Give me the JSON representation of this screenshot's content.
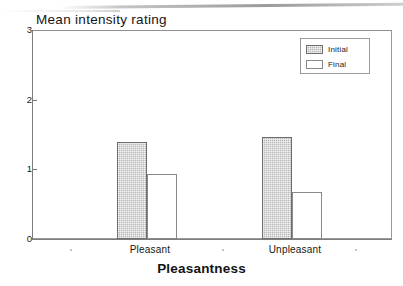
{
  "chart_data": {
    "type": "bar",
    "title": "Mean intensity rating",
    "xlabel": "Pleasantness",
    "ylabel": "",
    "categories": [
      "Pleasant",
      "Unpleasant"
    ],
    "series": [
      {
        "name": "Initial",
        "values": [
          1.39,
          1.47
        ],
        "color": "#b9b9b9"
      },
      {
        "name": "Final",
        "values": [
          0.93,
          0.68
        ],
        "color": "#ffffff"
      }
    ],
    "ylim": [
      0,
      3
    ],
    "yticks": [
      0,
      1,
      2,
      3
    ],
    "ytick_labels": [
      "0",
      "1",
      "2",
      "3"
    ],
    "grid": false,
    "legend_position": "top-right"
  },
  "legend": {
    "items": [
      {
        "label": "Initial",
        "swatch": "gray-hatched-swatch"
      },
      {
        "label": "Final",
        "swatch": "white-swatch"
      }
    ]
  },
  "colors": {
    "initial_fill": "#b9b9b9",
    "final_fill": "#ffffff",
    "axis": "#7d7d7d",
    "frame": "#9a9a9a",
    "text": "#161616",
    "background": "#ffffff"
  }
}
